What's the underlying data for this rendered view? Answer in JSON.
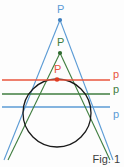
{
  "figure": {
    "caption": "Fig. 1",
    "background_color": "#fdfdfd",
    "circle": {
      "name": "conic-circle",
      "cx": 57,
      "cy": 113,
      "r": 34,
      "color": "#1a1a1a",
      "stroke_width": 1.3
    },
    "constructions": [
      {
        "id": "blue",
        "color": "#5b9bd5",
        "pole_label": "P",
        "pole_label_x": 57,
        "pole_label_y": 4,
        "pole_x": 60,
        "pole_y": 20,
        "polar_label": "p",
        "polar_label_x": 113,
        "polar_label_y": 108,
        "polar_y": 107,
        "polar_x1": 2,
        "polar_x2": 110,
        "tangent_left_x": 27.2,
        "tangent_left_y": 84.0,
        "tangent_right_x": 89.4,
        "tangent_right_y": 99.5,
        "tangent_extend_left_x": 4,
        "tangent_extend_left_y": 160,
        "tangent_extend_right_x": 113,
        "tangent_extend_right_y": 160
      },
      {
        "id": "green",
        "color": "#3f7d3f",
        "pole_label": "P",
        "pole_label_x": 57,
        "pole_label_y": 37,
        "pole_x": 60,
        "pole_y": 53,
        "polar_label": "p",
        "polar_label_x": 113,
        "polar_label_y": 85,
        "polar_y": 94,
        "polar_x1": 2,
        "polar_x2": 110,
        "tangent_left_x": 25.5,
        "tangent_left_y": 97.5,
        "tangent_right_x": 90.0,
        "tangent_right_y": 104.0,
        "tangent_extend_left_x": 8,
        "tangent_extend_left_y": 160,
        "tangent_extend_right_x": 110,
        "tangent_extend_right_y": 160
      },
      {
        "id": "red",
        "color": "#e8553c",
        "pole_label": "P",
        "pole_label_x": 54,
        "pole_label_y": 64,
        "pole_x": 57,
        "pole_y": 79,
        "polar_label": "p",
        "polar_label_x": 113,
        "polar_label_y": 70,
        "polar_y": 80,
        "polar_x1": 2,
        "polar_x2": 110
      }
    ],
    "labels": {
      "pole_symbol": "P",
      "polar_symbol": "p"
    }
  }
}
